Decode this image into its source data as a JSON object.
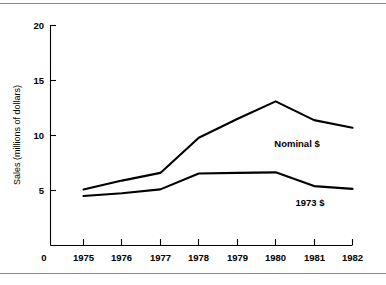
{
  "chart_data": {
    "type": "line",
    "title": "",
    "xlabel": "",
    "ylabel": "Sales (millions of dollars)",
    "x": [
      1975,
      1976,
      1977,
      1978,
      1979,
      1980,
      1981,
      1982
    ],
    "categories": [
      "1975",
      "1976",
      "1977",
      "1978",
      "1979",
      "1980",
      "1981",
      "1982"
    ],
    "xtick_labels": [
      "1975",
      "1976",
      "1977",
      "1978",
      "1979",
      "1980",
      "1981",
      "1982"
    ],
    "ytick_labels": [
      "5",
      "10",
      "15",
      "20"
    ],
    "ytick_values": [
      5,
      10,
      15,
      20
    ],
    "origin_label": "0",
    "xlim": [
      1975,
      1982
    ],
    "ylim": [
      0,
      20
    ],
    "grid": false,
    "legend_position": "inline-annotation",
    "series": [
      {
        "name": "Nominal $",
        "label": "Nominal $",
        "values": [
          5.1,
          5.9,
          6.6,
          9.8,
          11.5,
          13.1,
          11.4,
          10.7
        ],
        "color": "#000000"
      },
      {
        "name": "1973 $",
        "label": "1973 $",
        "values": [
          4.5,
          4.75,
          5.1,
          6.55,
          6.6,
          6.65,
          5.4,
          5.15
        ],
        "color": "#000000"
      }
    ],
    "annotations": [
      {
        "text": "Nominal $",
        "series": "Nominal $"
      },
      {
        "text": "1973 $",
        "series": "1973 $"
      }
    ]
  }
}
